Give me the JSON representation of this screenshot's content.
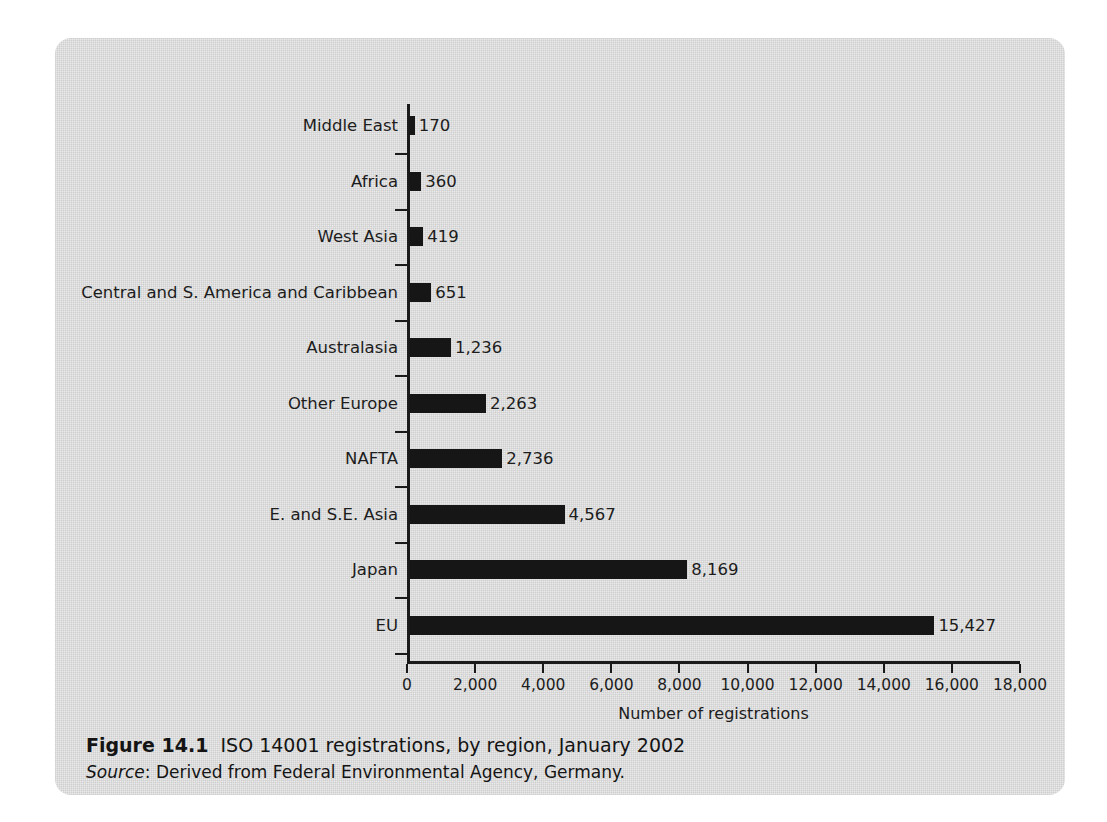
{
  "chart_data": {
    "type": "bar",
    "orientation": "horizontal",
    "title": "ISO 14001 registrations, by region, January 2002",
    "xlabel": "Number of registrations",
    "ylabel": "",
    "xlim": [
      0,
      18000
    ],
    "xticks": [
      "0",
      "2,000",
      "4,000",
      "6,000",
      "8,000",
      "10,000",
      "12,000",
      "14,000",
      "16,000",
      "18,000"
    ],
    "xtick_values": [
      0,
      2000,
      4000,
      6000,
      8000,
      10000,
      12000,
      14000,
      16000,
      18000
    ],
    "grid": false,
    "legend": false,
    "bar_color": "#161616",
    "categories": [
      "Middle East",
      "Africa",
      "West Asia",
      "Central and S. America and Caribbean",
      "Australasia",
      "Other Europe",
      "NAFTA",
      "E. and S.E. Asia",
      "Japan",
      "EU"
    ],
    "values": [
      170,
      360,
      419,
      651,
      1236,
      2263,
      2736,
      4567,
      8169,
      15427
    ],
    "value_labels": [
      "170",
      "360",
      "419",
      "651",
      "1,236",
      "2,263",
      "2,736",
      "4,567",
      "8,169",
      "15,427"
    ]
  },
  "caption": {
    "figure_number": "Figure 14.1",
    "figure_title": "ISO 14001 registrations, by region, January 2002",
    "source_label": "Source",
    "source_text": ": Derived from Federal Environmental Agency, Germany."
  }
}
